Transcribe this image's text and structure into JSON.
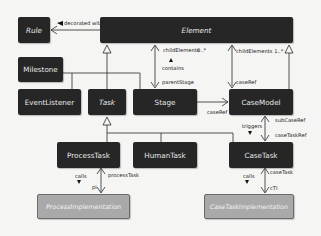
{
  "diagram": {
    "type": "uml-class-diagram",
    "classes": {
      "rule": "Rule",
      "element": "Element",
      "milestone": "Milestone",
      "event_listener": "EventListener",
      "task": "Task",
      "stage": "Stage",
      "case_model": "CaseModel",
      "process_task": "ProcessTask",
      "human_task": "HumanTask",
      "case_task": "CaseTask",
      "process_implementation": "ProcessImplementation",
      "case_task_implementation": "CaseTaskImplementation"
    },
    "labels": {
      "decorated_with": "decorated with",
      "child_elements_0": "childElements",
      "mult_0": "0..*",
      "contains": "contains",
      "parent_stage": "parentStage",
      "child_elements_1": "childElements 1..*",
      "case_ref_top": "caseRef",
      "case_ref_stage": "caseRef",
      "sub_case_ref": "subCaseRef",
      "triggers": "triggers",
      "case_task_ref": "caseTaskRef",
      "calls_left": "calls",
      "process_task": "processTask",
      "pi": "pi",
      "calls_right": "calls",
      "case_task": "caseTask",
      "cti": "cTI"
    },
    "colors": {
      "class_fill": "#262626",
      "implementation_fill": "#a9a9a9",
      "line": "#2a2a2a",
      "background": "#f5f5f3"
    }
  }
}
